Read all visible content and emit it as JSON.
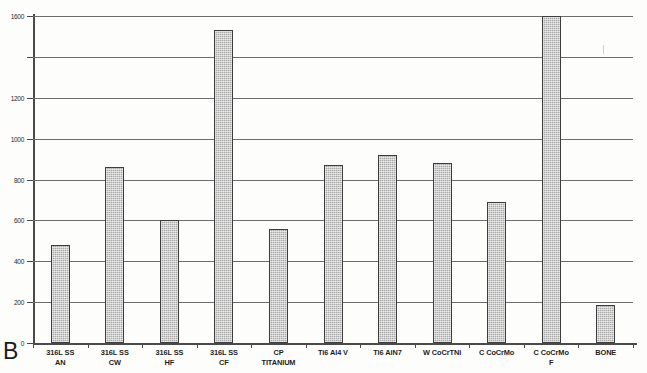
{
  "figure": {
    "panel_letter": "B",
    "background_color": "#fdfdfc",
    "bar_fill_color": "#a8a8a8",
    "bar_edge_color": "#3d3d3d",
    "grid_color": "#6d6d6d",
    "axis_color": "#4a4a4a"
  },
  "chart_data": {
    "type": "bar",
    "title": "",
    "subtitle": "",
    "xlabel": "",
    "ylabel": "",
    "ylim": [
      0,
      1600
    ],
    "yticks": [
      0,
      200,
      400,
      600,
      800,
      1000,
      1200,
      1600
    ],
    "ytick_labels": [
      "0",
      "200",
      "400",
      "600",
      "800",
      "1000",
      "1200",
      "1600"
    ],
    "grid": true,
    "grid_axis": "y",
    "legend": false,
    "legend_position": "none",
    "categories": [
      "316L SS AN",
      "316L SS CW",
      "316L SS HF",
      "316L SS CF",
      "CP TITANIUM",
      "Ti6 Al4 V",
      "Ti6 AlN7",
      "W CoCrTNi",
      "C CoCrMo",
      "C CoCrMo F",
      "BONE"
    ],
    "category_lines": [
      [
        "316L SS",
        "AN"
      ],
      [
        "316L SS",
        "CW"
      ],
      [
        "316L SS",
        "HF"
      ],
      [
        "316L SS",
        "CF"
      ],
      [
        "CP",
        "TITANIUM"
      ],
      [
        "Ti6 Al4 V",
        ""
      ],
      [
        "Ti6 AlN7",
        ""
      ],
      [
        "W CoCrTNi",
        ""
      ],
      [
        "C CoCrMo",
        ""
      ],
      [
        "C CoCrMo",
        "F"
      ],
      [
        "BONE",
        ""
      ]
    ],
    "values": [
      480,
      860,
      600,
      1530,
      560,
      870,
      920,
      880,
      690,
      1600,
      185
    ]
  }
}
